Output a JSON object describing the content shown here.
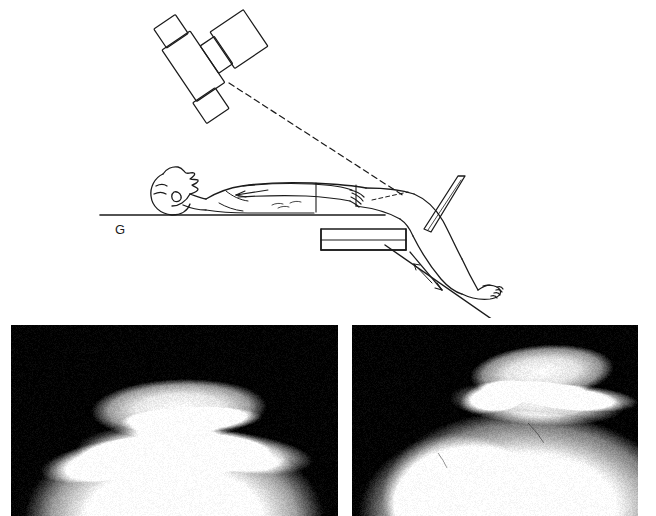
{
  "figure": {
    "top_caption": "",
    "kind": "radiographic-positioning-figure"
  },
  "diagram": {
    "name": "tangential-patella-positioning-diagram",
    "labels": [
      {
        "id": "grid-label",
        "text": "G",
        "x": 115,
        "y": 222
      }
    ],
    "elements": [
      {
        "name": "xray-tube-head",
        "description": "collimated x-ray tube assembly angled toward the knee"
      },
      {
        "name": "central-ray",
        "description": "dashed central ray from tube to patellofemoral joint"
      },
      {
        "name": "patient-supine",
        "description": "supine patient on radiographic table, knee flexed over table end"
      },
      {
        "name": "radiographic-table",
        "description": "table top with end edge"
      },
      {
        "name": "image-receptor-cassette",
        "description": "cassette held against the distal thigh above the knee"
      },
      {
        "name": "leg-direction-arrow",
        "description": "arrow indicating leg flexion direction"
      },
      {
        "name": "arm-direction-arrow",
        "description": "arrow along the arm"
      }
    ]
  },
  "radiographs": {
    "name": "tangential-patella-radiographs",
    "items": [
      {
        "id": "xray-left",
        "caption": "",
        "view": "tangential patella (skyline) projection"
      },
      {
        "id": "xray-right",
        "caption": "",
        "view": "tangential patella (skyline) projection, oblique"
      }
    ],
    "background_color": "#000000"
  },
  "colors": {
    "page_background": "#ffffff",
    "ink": "#1b1b1b",
    "radiograph_background": "#000000"
  }
}
